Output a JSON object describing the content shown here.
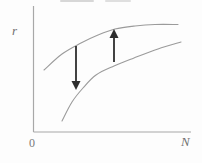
{
  "figure": {
    "labels": {
      "y": "r",
      "x": "N",
      "origin": "0"
    },
    "colors": {
      "background": "#fdfdfd",
      "axis": "#a8a8a8",
      "curve": "#9b9b9b",
      "arrow": "#2e2e2e",
      "label": "#6f6f6f"
    },
    "axes_px": {
      "origin": [
        33.5,
        132
      ],
      "y_top": 6,
      "x_right": 191
    }
  },
  "chart_data": {
    "type": "line",
    "title": "",
    "xlabel": "N",
    "ylabel": "r",
    "axis_tick_labels": [
      "0"
    ],
    "axis_numeric_scale": "none (schematic axes, unlabeled ticks)",
    "grid": false,
    "legend": "none",
    "series": [
      {
        "name": "upper-curve",
        "points_px": [
          [
            44,
            70
          ],
          [
            62,
            54
          ],
          [
            81,
            43
          ],
          [
            98,
            35
          ],
          [
            115,
            29
          ],
          [
            135,
            26
          ],
          [
            155,
            24.5
          ],
          [
            178,
            24.5
          ]
        ]
      },
      {
        "name": "lower-curve",
        "points_px": [
          [
            62,
            121
          ],
          [
            72,
            102
          ],
          [
            83,
            88
          ],
          [
            96,
            75
          ],
          [
            114,
            66
          ],
          [
            134,
            58
          ],
          [
            158,
            49
          ],
          [
            181,
            42
          ]
        ]
      }
    ],
    "annotations": [
      {
        "name": "down-arrow",
        "direction": "down",
        "from_px": [
          76,
          46
        ],
        "to_px": [
          76,
          90
        ]
      },
      {
        "name": "up-arrow",
        "direction": "up",
        "from_px": [
          114,
          62
        ],
        "to_px": [
          114,
          29
        ]
      }
    ]
  }
}
